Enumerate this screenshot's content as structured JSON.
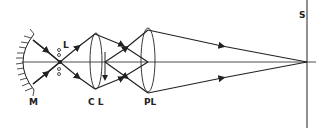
{
  "diagram": {
    "type": "optical-ray-diagram",
    "colors": {
      "line": "#222222",
      "background": "#ffffff"
    },
    "labels": {
      "mirror": "M",
      "lamp": "L",
      "condenser_lens": "C L",
      "projection_lens": "PL",
      "screen": "S"
    },
    "components": [
      {
        "id": "mirror",
        "label": "M",
        "kind": "concave-mirror"
      },
      {
        "id": "lamp",
        "label": "L",
        "kind": "light-source"
      },
      {
        "id": "condenser_lens",
        "label": "C L",
        "kind": "convex-lens"
      },
      {
        "id": "projection_lens",
        "label": "PL",
        "kind": "convex-lens"
      },
      {
        "id": "screen",
        "label": "S",
        "kind": "screen"
      }
    ]
  }
}
